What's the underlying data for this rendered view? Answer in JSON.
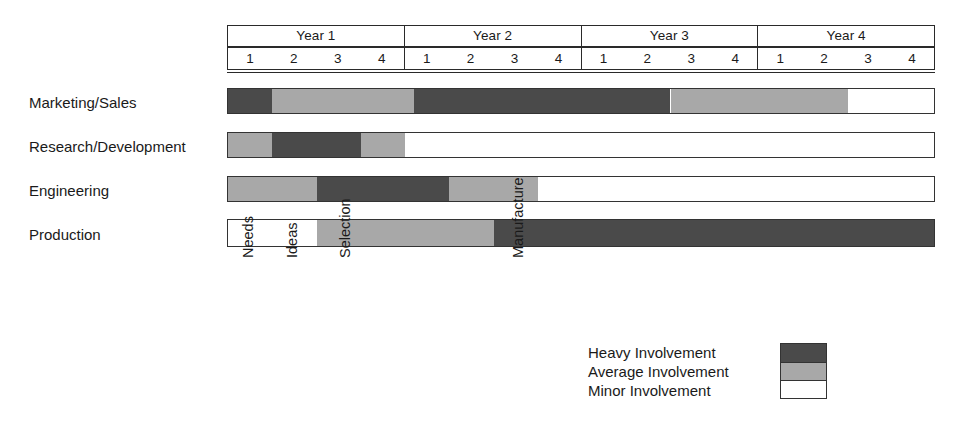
{
  "chart_data": {
    "type": "bar",
    "title": "",
    "xlabel": "",
    "ylabel": "",
    "axis": {
      "unit": "quarter",
      "total_quarters": 16,
      "years": [
        "Year 1",
        "Year 2",
        "Year 3",
        "Year 4"
      ],
      "quarters": [
        "1",
        "2",
        "3",
        "4"
      ]
    },
    "legend": {
      "position": "bottom-right",
      "entries": [
        {
          "label": "Heavy Involvement",
          "color": "#4a4a4a",
          "key": "heavy"
        },
        {
          "label": "Average Involvement",
          "color": "#a8a8a8",
          "key": "average"
        },
        {
          "label": "Minor Involvement",
          "color": "#ffffff",
          "key": "minor"
        }
      ]
    },
    "categories": [
      "Marketing/Sales",
      "Research/Development",
      "Engineering",
      "Production"
    ],
    "series": [
      {
        "name": "Marketing/Sales",
        "segments": [
          {
            "level": "heavy",
            "start_quarter": 0,
            "end_quarter": 1,
            "color": "#4a4a4a"
          },
          {
            "level": "average",
            "start_quarter": 1,
            "end_quarter": 4.2,
            "color": "#a8a8a8"
          },
          {
            "level": "heavy",
            "start_quarter": 4.2,
            "end_quarter": 10,
            "color": "#4a4a4a"
          },
          {
            "level": "average",
            "start_quarter": 10,
            "end_quarter": 14,
            "color": "#a8a8a8"
          },
          {
            "level": "minor",
            "start_quarter": 14,
            "end_quarter": 16,
            "color": "#ffffff"
          }
        ]
      },
      {
        "name": "Research/Development",
        "segments": [
          {
            "level": "average",
            "start_quarter": 0,
            "end_quarter": 1,
            "color": "#a8a8a8"
          },
          {
            "level": "heavy",
            "start_quarter": 1,
            "end_quarter": 3,
            "color": "#4a4a4a"
          },
          {
            "level": "average",
            "start_quarter": 3,
            "end_quarter": 4,
            "color": "#a8a8a8"
          },
          {
            "level": "minor",
            "start_quarter": 4,
            "end_quarter": 16,
            "color": "#ffffff"
          }
        ]
      },
      {
        "name": "Engineering",
        "segments": [
          {
            "level": "average",
            "start_quarter": 0,
            "end_quarter": 2,
            "color": "#a8a8a8"
          },
          {
            "level": "heavy",
            "start_quarter": 2,
            "end_quarter": 5,
            "color": "#4a4a4a"
          },
          {
            "level": "average",
            "start_quarter": 5,
            "end_quarter": 7,
            "color": "#a8a8a8"
          },
          {
            "level": "minor",
            "start_quarter": 7,
            "end_quarter": 16,
            "color": "#ffffff"
          }
        ]
      },
      {
        "name": "Production",
        "segments": [
          {
            "level": "minor",
            "start_quarter": 0,
            "end_quarter": 2,
            "color": "#ffffff"
          },
          {
            "level": "average",
            "start_quarter": 2,
            "end_quarter": 6,
            "color": "#a8a8a8"
          },
          {
            "level": "heavy",
            "start_quarter": 6,
            "end_quarter": 16,
            "color": "#4a4a4a"
          }
        ]
      }
    ],
    "milestones": [
      {
        "label": "Needs",
        "quarter": 0.0
      },
      {
        "label": "Ideas",
        "quarter": 1.0
      },
      {
        "label": "Selection",
        "quarter": 2.2
      },
      {
        "label": "Manufacture",
        "quarter": 6.1
      }
    ]
  },
  "colors": {
    "heavy": "#4a4a4a",
    "average": "#a8a8a8",
    "minor": "#ffffff",
    "outline": "#333333",
    "text": "#1a1a1a"
  }
}
